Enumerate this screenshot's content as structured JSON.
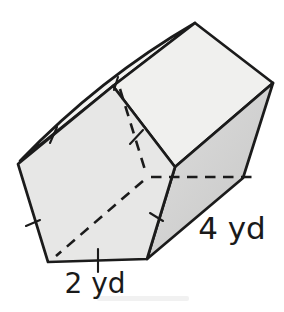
{
  "figure": {
    "type": "pentagonal-prism-diagram",
    "labels": {
      "base_edge": "2 yd",
      "prism_length": "4 yd"
    },
    "colors": {
      "outline": "#1b1b1b",
      "front_face": "#e7e7e6",
      "top_face": "#f0f0ee",
      "right_face_light": "#dedede",
      "right_face_dark": "#c6c6c5",
      "sliver_face": "#f3f3f1",
      "background": "#ffffff",
      "label_text": "#1a1a1a",
      "smudge": "#e9e9e9"
    },
    "geometry": {
      "front_pentagon": [
        [
          18,
          164
        ],
        [
          113,
          86
        ],
        [
          175,
          167
        ],
        [
          147,
          259
        ],
        [
          48,
          262
        ]
      ],
      "top_face": [
        [
          113,
          86
        ],
        [
          195,
          23
        ],
        [
          273,
          83
        ],
        [
          175,
          167
        ]
      ],
      "right_face": [
        [
          175,
          167
        ],
        [
          273,
          83
        ],
        [
          243,
          178
        ],
        [
          147,
          259
        ]
      ],
      "sliver_upper_start": [
        20,
        161
      ],
      "sliver_control": [
        100,
        78
      ],
      "apex": [
        195,
        23
      ],
      "dashed_lines": [
        {
          "name": "hidden-back-edge-upper",
          "from": [
            120,
            89
          ],
          "to": [
            146,
            173
          ]
        },
        {
          "name": "hidden-back-edge-bottom",
          "from": [
            151,
            177
          ],
          "to": [
            258,
            177
          ]
        },
        {
          "name": "hidden-lateral-edge",
          "from": [
            143,
            181
          ],
          "to": [
            56,
            256
          ]
        }
      ],
      "tick_marks": [
        {
          "name": "tick-upper-left-edge",
          "from": [
            57,
            127
          ],
          "to": [
            50,
            143
          ]
        },
        {
          "name": "tick-lower-left-edge",
          "from": [
            26,
            226
          ],
          "to": [
            40,
            220
          ]
        },
        {
          "name": "tick-bottom-edge",
          "from": [
            98,
            249
          ],
          "to": [
            98,
            272
          ]
        },
        {
          "name": "tick-lower-right-edge",
          "from": [
            150,
            213
          ],
          "to": [
            163,
            221
          ]
        },
        {
          "name": "tick-upper-right-edge",
          "from": [
            130,
            144
          ],
          "to": [
            143,
            130
          ]
        },
        {
          "name": "tick-top-junction",
          "from": [
            118,
            77
          ],
          "to": [
            114,
            90
          ]
        }
      ],
      "smudge_rect": {
        "x": 97,
        "y": 296,
        "w": 92,
        "h": 5
      }
    }
  }
}
